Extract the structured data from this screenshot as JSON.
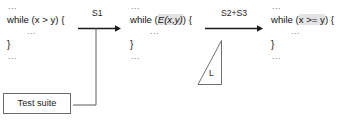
{
  "diagram": {
    "background_color": "#ffffff",
    "line_color": "#1a1a1a",
    "highlight_color": "#e3e3e3"
  },
  "blocks": {
    "original": {
      "name": "original-program",
      "lines": [
        {
          "kind": "dots",
          "text": "..."
        },
        {
          "kind": "code",
          "prefix": "while (",
          "expr": "x > y",
          "suffix": ") {",
          "highlight": false,
          "italic": false
        },
        {
          "kind": "dots-indent",
          "text": "..."
        },
        {
          "kind": "brace",
          "text": "}"
        },
        {
          "kind": "dots",
          "text": "..."
        }
      ]
    },
    "mutant": {
      "name": "mutant-program",
      "lines": [
        {
          "kind": "dots",
          "text": "..."
        },
        {
          "kind": "code",
          "prefix": "while (",
          "expr": "E(x,y)",
          "suffix": ") {",
          "highlight": true,
          "italic": true
        },
        {
          "kind": "dots-indent",
          "text": "..."
        },
        {
          "kind": "brace",
          "text": "}"
        },
        {
          "kind": "dots",
          "text": "..."
        }
      ]
    },
    "fixed": {
      "name": "fixed-program",
      "lines": [
        {
          "kind": "dots",
          "text": "..."
        },
        {
          "kind": "code",
          "prefix": "while (",
          "expr": "x >= y",
          "suffix": ") {",
          "highlight": true,
          "italic": false
        },
        {
          "kind": "dots-indent",
          "text": "..."
        },
        {
          "kind": "brace",
          "text": "}"
        },
        {
          "kind": "dots",
          "text": "..."
        }
      ]
    }
  },
  "arrows": {
    "first": {
      "label": "S1"
    },
    "second": {
      "label": "S2+S3"
    }
  },
  "triangle": {
    "label": "L"
  },
  "test_suite": {
    "label": "Test suite"
  }
}
